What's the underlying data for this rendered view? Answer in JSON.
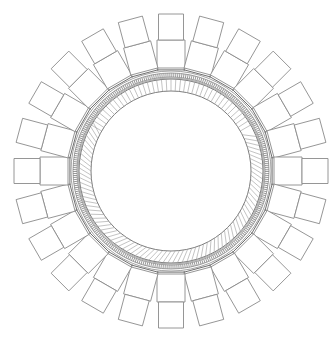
{
  "diagram": {
    "title": "",
    "type": "radial-ring-assembly",
    "width": 336,
    "height": 340,
    "center": {
      "x": 171,
      "y": 171
    },
    "colors": {
      "background": "#ffffff",
      "line": "#8a8a8a",
      "dark_line": "#6e6e6e",
      "hatch": "#9a9a9a"
    },
    "ring": {
      "inner_radius": 80,
      "hatch_band": {
        "r_in": 80,
        "r_out": 92
      },
      "dotted_band": {
        "r_in": 94,
        "r_out": 98
      },
      "outer_radius": 101,
      "polygon_sides": 24
    },
    "blocks": {
      "count": 24,
      "angle_step_deg": 15,
      "inner_block": {
        "r_start": 101,
        "r_end": 131,
        "width": 28
      },
      "outer_block": {
        "r_start": 131,
        "r_end": 157,
        "width": 25
      }
    }
  }
}
